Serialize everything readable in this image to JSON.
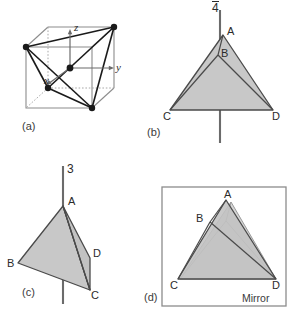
{
  "figure": {
    "background_color": "#ffffff",
    "fill_color": "#c8c8c8",
    "stroke_color": "#3a3a3a",
    "cube_edge_color": "#8c8c8c",
    "axis_color": "#6b6b6b",
    "vertex_dot_color": "#1a1a1a"
  },
  "panels": {
    "a": {
      "label": "(a)",
      "axes": [
        {
          "name": "z-axis-label",
          "text": "z"
        },
        {
          "name": "y-axis-label",
          "text": "y"
        },
        {
          "name": "x-axis-label",
          "text": "x"
        }
      ]
    },
    "b": {
      "label": "(b)",
      "symmetry_symbol": "4",
      "symmetry_symbol_overbar": true,
      "vertices": [
        {
          "id": "A",
          "text": "A"
        },
        {
          "id": "B",
          "text": "B"
        },
        {
          "id": "C",
          "text": "C"
        },
        {
          "id": "D",
          "text": "D"
        }
      ]
    },
    "c": {
      "label": "(c)",
      "symmetry_symbol": "3",
      "symmetry_symbol_overbar": false,
      "vertices": [
        {
          "id": "A",
          "text": "A"
        },
        {
          "id": "B",
          "text": "B"
        },
        {
          "id": "C",
          "text": "C"
        },
        {
          "id": "D",
          "text": "D"
        }
      ]
    },
    "d": {
      "label": "(d)",
      "caption": "Mirror",
      "vertices": [
        {
          "id": "A",
          "text": "A"
        },
        {
          "id": "B",
          "text": "B"
        },
        {
          "id": "C",
          "text": "C"
        },
        {
          "id": "D",
          "text": "D"
        }
      ]
    }
  }
}
